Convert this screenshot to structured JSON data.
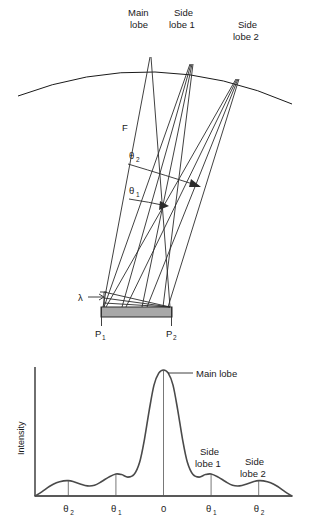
{
  "figure": {
    "title_top": "Diffraction grating ray diagram",
    "title_bottom": "Intensity distribution"
  },
  "top_diagram": {
    "labels": {
      "main_lobe_line1": "Main",
      "main_lobe_line2": "lobe",
      "side_lobe1_line1": "Side",
      "side_lobe1_line2": "lobe 1",
      "side_lobe2_line1": "Side",
      "side_lobe2_line2": "lobe 2",
      "focal_label": "F",
      "theta2": "θ",
      "theta2_sub": "2",
      "theta1": "θ",
      "theta1_sub": "1",
      "lambda": "λ",
      "p1": "P",
      "p1_sub": "1",
      "p2": "P",
      "p2_sub": "2"
    },
    "colors": {
      "line": "#1a1a1a",
      "grating": "#a8a8a8",
      "grating_edge": "#2b2b2b"
    }
  },
  "bottom_chart": {
    "y_axis_label": "Intensity",
    "annotation_main_lobe": "Main lobe",
    "annotation_side_lobe1_line1": "Side",
    "annotation_side_lobe1_line2": "lobe 1",
    "annotation_side_lobe2_line1": "Side",
    "annotation_side_lobe2_line2": "lobe 2",
    "x_ticks": [
      {
        "label": "θ",
        "sub": "2"
      },
      {
        "label": "θ",
        "sub": "1"
      },
      {
        "label": "0",
        "sub": ""
      },
      {
        "label": "θ",
        "sub": "1"
      },
      {
        "label": "θ",
        "sub": "2"
      }
    ]
  },
  "chart_data": {
    "type": "line",
    "title": "Intensity",
    "xlabel": "",
    "ylabel": "Intensity",
    "grid": false,
    "legend": null,
    "x_tick_labels": [
      "θ2",
      "θ1",
      "0",
      "θ1",
      "θ2"
    ],
    "x_tick_positions": [
      -2,
      -1,
      0,
      1,
      2
    ],
    "xlim": [
      -2.7,
      2.7
    ],
    "ylim": [
      0,
      1.0
    ],
    "annotations": [
      {
        "text": "Main lobe",
        "x": 0,
        "y": 1.0
      },
      {
        "text": "Side lobe 1",
        "x": 1,
        "y": 0.17
      },
      {
        "text": "Side lobe 2",
        "x": 2,
        "y": 0.12
      }
    ],
    "series": [
      {
        "name": "Intensity",
        "x": [
          -2.7,
          -2.55,
          -2.4,
          -2.25,
          -2.1,
          -2.0,
          -1.9,
          -1.75,
          -1.6,
          -1.45,
          -1.3,
          -1.15,
          -1.0,
          -0.88,
          -0.75,
          -0.62,
          -0.5,
          -0.4,
          -0.3,
          -0.2,
          -0.1,
          0.0,
          0.1,
          0.2,
          0.3,
          0.4,
          0.5,
          0.62,
          0.75,
          0.88,
          1.0,
          1.15,
          1.3,
          1.45,
          1.6,
          1.75,
          1.9,
          2.0,
          2.1,
          2.25,
          2.4,
          2.55,
          2.7
        ],
        "y": [
          0.0,
          0.035,
          0.075,
          0.105,
          0.12,
          0.122,
          0.115,
          0.095,
          0.08,
          0.085,
          0.115,
          0.15,
          0.175,
          0.17,
          0.15,
          0.17,
          0.27,
          0.45,
          0.68,
          0.88,
          0.975,
          1.0,
          0.975,
          0.88,
          0.68,
          0.45,
          0.27,
          0.17,
          0.15,
          0.17,
          0.175,
          0.15,
          0.115,
          0.085,
          0.08,
          0.095,
          0.115,
          0.122,
          0.12,
          0.105,
          0.075,
          0.035,
          0.0
        ]
      }
    ]
  }
}
